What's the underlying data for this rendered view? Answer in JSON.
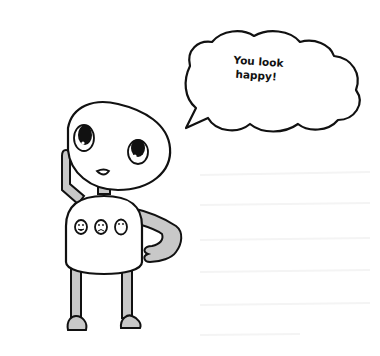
{
  "illustration": {
    "subject": "robot-character",
    "speech_bubble": {
      "line1": "You look",
      "line2": "happy!"
    },
    "chest_buttons": [
      "happy-face",
      "sad-face",
      "neutral-face"
    ],
    "colors": {
      "outline": "#111111",
      "limbs": "#c8c8c8",
      "body": "#ffffff",
      "background": "#ffffff"
    }
  }
}
